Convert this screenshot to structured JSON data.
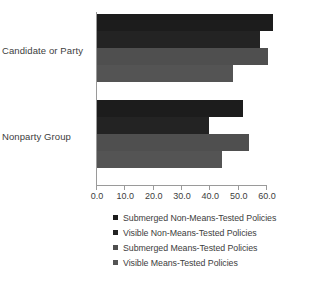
{
  "chart_data": {
    "type": "bar",
    "orientation": "horizontal",
    "title": "",
    "xlabel": "",
    "ylabel": "",
    "categories": [
      "Candidate or Party",
      "Nonparty Group"
    ],
    "series": [
      {
        "name": "Submerged Non-Means-Tested Policies",
        "color": "#1c1c1c",
        "values": [
          62.0,
          51.5
        ]
      },
      {
        "name": "Visible Non-Means-Tested Policies",
        "color": "#232323",
        "values": [
          57.5,
          39.5
        ]
      },
      {
        "name": "Submerged Means-Tested Policies",
        "color": "#4f4f4f",
        "values": [
          60.5,
          53.5
        ]
      },
      {
        "name": "Visible Means-Tested Policies",
        "color": "#545454",
        "values": [
          48.0,
          44.0
        ]
      }
    ],
    "xlim": [
      0.0,
      60.0
    ],
    "xticks": [
      0.0,
      10.0,
      20.0,
      30.0,
      40.0,
      50.0,
      60.0
    ],
    "xtick_labels": [
      "0.0",
      "10.0",
      "20.0",
      "30.0",
      "40.0",
      "50.0",
      "60.0"
    ],
    "grid": false,
    "legend_position": "bottom"
  },
  "axis": {
    "tick_labels": [
      "0.0",
      "10.0",
      "20.0",
      "30.0",
      "40.0",
      "50.0",
      "60.0"
    ]
  },
  "legend": {
    "items": [
      {
        "label": "Submerged Non-Means-Tested Policies"
      },
      {
        "label": "Visible Non-Means-Tested Policies"
      },
      {
        "label": "Submerged Means-Tested Policies"
      },
      {
        "label": "Visible Means-Tested Policies"
      }
    ]
  }
}
